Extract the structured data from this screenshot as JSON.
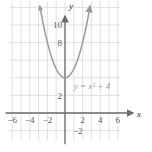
{
  "figure": {
    "name": "parabola-graph",
    "equation_label": "y = x² + 4",
    "axis_label_x": "x",
    "axis_label_y": "y"
  },
  "colors": {
    "grid": "#d9d9d9",
    "axis": "#6b6b6b",
    "curve": "#9a9a9a",
    "text": "#5a5a5a",
    "background": "#ffffff"
  },
  "chart_data": {
    "type": "line",
    "title": "",
    "xlabel": "x",
    "ylabel": "y",
    "equation": "y = x^2 + 4",
    "annotations": [
      {
        "text": "y = x² + 4",
        "x": 1.0,
        "y": 2.7
      }
    ],
    "xlim": [
      -6.8,
      6.3
    ],
    "ylim": [
      -3.3,
      13.0
    ],
    "grid": true,
    "legend": "none",
    "xticks": [
      -6,
      -4,
      -2,
      2,
      4,
      6
    ],
    "xtick_labels": [
      "−6",
      "−4",
      "−2",
      "2",
      "4",
      "6"
    ],
    "yticks": [
      -2,
      2,
      8,
      10
    ],
    "ytick_labels": [
      "−2",
      "2",
      "8",
      "10"
    ],
    "series": [
      {
        "name": "y = x^2 + 4",
        "arrow_start": true,
        "arrow_end": true,
        "x": [
          -2.85,
          -2.6,
          -2.4,
          -2.2,
          -2.0,
          -1.8,
          -1.6,
          -1.4,
          -1.2,
          -1.0,
          -0.8,
          -0.6,
          -0.4,
          -0.2,
          0,
          0.2,
          0.4,
          0.6,
          0.8,
          1.0,
          1.2,
          1.4,
          1.6,
          1.8,
          2.0,
          2.2,
          2.4,
          2.6,
          2.85
        ],
        "y": [
          12.12,
          10.76,
          9.76,
          8.84,
          8.0,
          7.24,
          6.56,
          5.96,
          5.44,
          5.0,
          4.64,
          4.36,
          4.16,
          4.04,
          4.0,
          4.04,
          4.16,
          4.36,
          4.64,
          5.0,
          5.44,
          5.96,
          6.56,
          7.24,
          8.0,
          8.84,
          9.76,
          10.76,
          12.12
        ]
      }
    ]
  }
}
